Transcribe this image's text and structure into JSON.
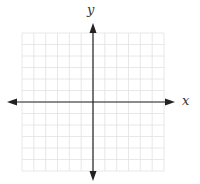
{
  "diagram": {
    "type": "coordinate-plane",
    "x_axis_label": "x",
    "y_axis_label": "y",
    "grid": {
      "columns": 12,
      "rows": 12,
      "left": 22,
      "top": 33,
      "right": 164,
      "bottom": 171
    },
    "origin": {
      "x": 93,
      "y": 102
    },
    "colors": {
      "grid": "#e2e2e2",
      "axis": "#222222",
      "background": "#ffffff"
    }
  }
}
